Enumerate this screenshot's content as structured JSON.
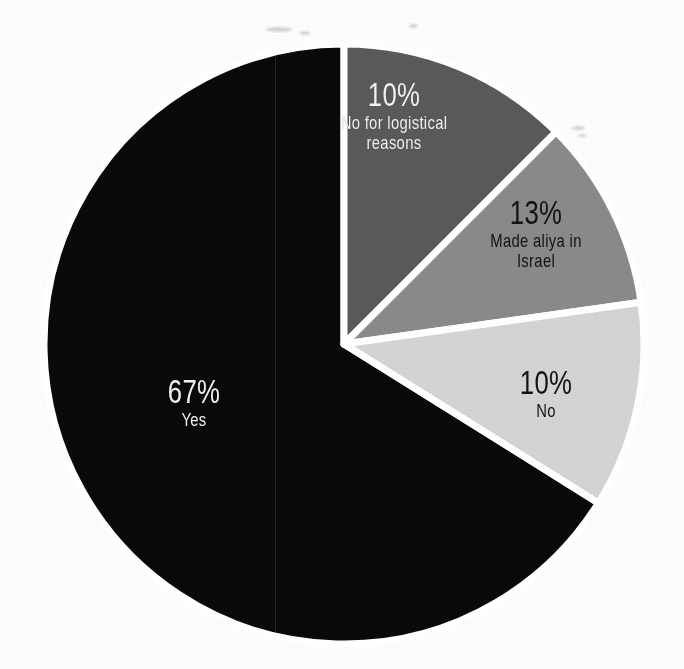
{
  "chart_data": {
    "type": "pie",
    "title": "",
    "subtitle": "",
    "xlabel": "",
    "ylabel": "",
    "legend_position": "none",
    "grid": false,
    "labels_inside_slices": true,
    "total_percent": 100,
    "categories": [
      "Yes",
      "No for logistical reasons",
      "Made aliya in Israel",
      "No"
    ],
    "values": [
      67,
      10,
      13,
      10
    ],
    "value_labels": [
      "67%",
      "10%",
      "13%",
      "10%"
    ],
    "slices": [
      {
        "id": "yes",
        "category": "Yes",
        "value": 67,
        "value_label": "67%",
        "color": "#0a0a0a",
        "text_color": "#f2f2f2",
        "start_angle": 122,
        "end_angle": 360
      },
      {
        "id": "no-logistical",
        "category": "No for logistical reasons",
        "category_line1": "No for logistical",
        "category_line2": "reasons",
        "value": 10,
        "value_label": "10%",
        "color": "#5a5a5a",
        "text_color": "#f2f2f2",
        "start_angle": 0,
        "end_angle": 45
      },
      {
        "id": "made-aliya",
        "category": "Made aliya in Israel",
        "category_line1": "Made aliya in",
        "category_line2": "Israel",
        "value": 13,
        "value_label": "13%",
        "color": "#8a8a8a",
        "text_color": "#131313",
        "start_angle": 45,
        "end_angle": 82
      },
      {
        "id": "no",
        "category": "No",
        "category_line1": "No",
        "category_line2": "",
        "value": 10,
        "value_label": "10%",
        "color": "#d4d4d4",
        "text_color": "#131313",
        "start_angle": 82,
        "end_angle": 122
      }
    ],
    "geometry": {
      "center_x": 344,
      "center_y": 344,
      "radius": 300,
      "separator_color": "#ffffff",
      "separator_width": 7
    },
    "background_color": "#fdfdfc"
  }
}
